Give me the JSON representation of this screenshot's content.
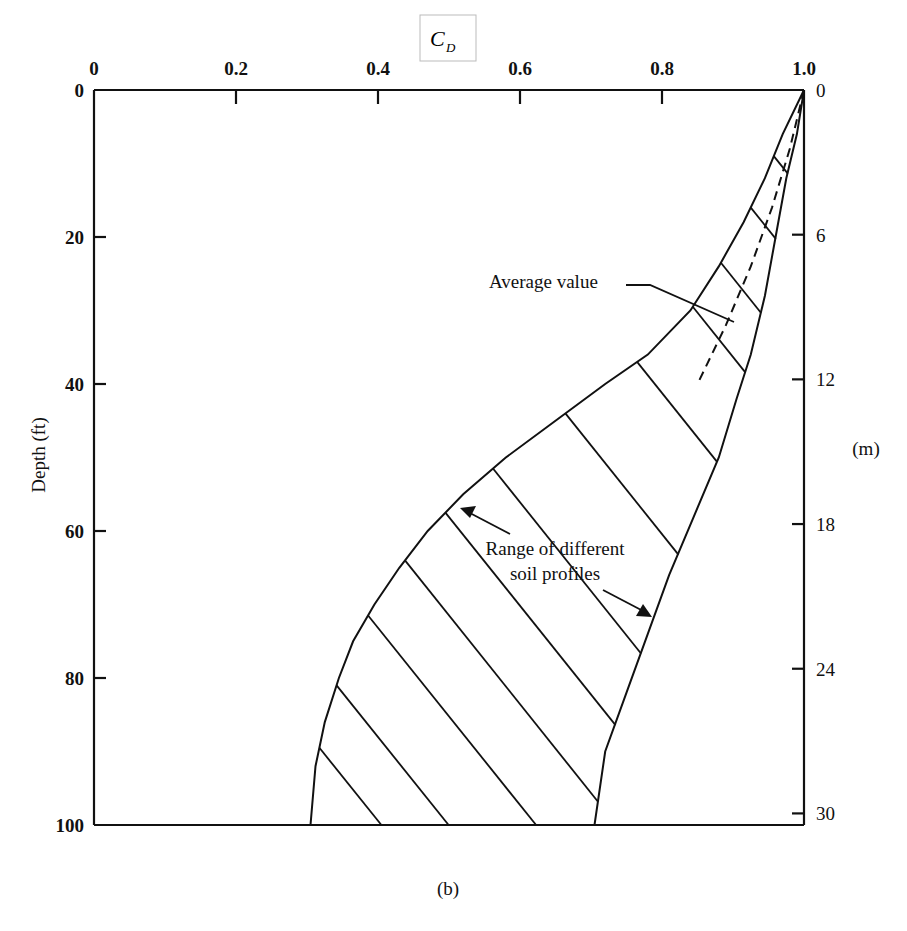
{
  "chart_data": {
    "type": "line",
    "title": "",
    "panel_label": "(b)",
    "xlabel": "C_D",
    "xlabel_main": "C",
    "xlabel_sub": "D",
    "ylabel": "Depth (ft)",
    "ylabel_right": "(m)",
    "xlim": [
      0,
      1.0
    ],
    "ylim": [
      0,
      100
    ],
    "y_inverted": true,
    "x_axis_position": "top",
    "x_ticks": [
      "0",
      "0.2",
      "0.4",
      "0.6",
      "0.8",
      "1.0"
    ],
    "x_tick_values": [
      0,
      0.2,
      0.4,
      0.6,
      0.8,
      1.0
    ],
    "y_ticks": [
      "0",
      "20",
      "40",
      "60",
      "80",
      "100"
    ],
    "y_tick_values": [
      0,
      20,
      40,
      60,
      80,
      100
    ],
    "y_right_ticks": [
      "0",
      "6",
      "12",
      "18",
      "24",
      "30"
    ],
    "y_right_tick_values_m": [
      0,
      6,
      12,
      18,
      24,
      30
    ],
    "grid": false,
    "series": [
      {
        "name": "Lower bound (range of different soil profiles)",
        "style": "solid",
        "points": [
          [
            1.0,
            0
          ],
          [
            0.97,
            6
          ],
          [
            0.945,
            12
          ],
          [
            0.915,
            18
          ],
          [
            0.88,
            24
          ],
          [
            0.84,
            30
          ],
          [
            0.78,
            36
          ],
          [
            0.72,
            40
          ],
          [
            0.65,
            45
          ],
          [
            0.58,
            50
          ],
          [
            0.52,
            55
          ],
          [
            0.47,
            60
          ],
          [
            0.43,
            65
          ],
          [
            0.395,
            70
          ],
          [
            0.365,
            75
          ],
          [
            0.345,
            80
          ],
          [
            0.325,
            86
          ],
          [
            0.312,
            92
          ],
          [
            0.305,
            100
          ]
        ]
      },
      {
        "name": "Upper bound (range of different soil profiles)",
        "style": "solid",
        "points": [
          [
            1.0,
            0
          ],
          [
            0.99,
            6
          ],
          [
            0.975,
            12
          ],
          [
            0.96,
            20
          ],
          [
            0.945,
            28
          ],
          [
            0.925,
            36
          ],
          [
            0.905,
            42
          ],
          [
            0.88,
            50
          ],
          [
            0.845,
            58
          ],
          [
            0.81,
            66
          ],
          [
            0.78,
            74
          ],
          [
            0.75,
            82
          ],
          [
            0.72,
            90
          ],
          [
            0.705,
            100
          ]
        ]
      },
      {
        "name": "Average value",
        "style": "dashed",
        "points": [
          [
            1.0,
            0
          ],
          [
            0.98,
            8
          ],
          [
            0.955,
            16
          ],
          [
            0.925,
            24
          ],
          [
            0.89,
            32
          ],
          [
            0.85,
            40
          ]
        ]
      }
    ],
    "annotations": [
      {
        "text": "Average value",
        "points_to": [
          0.88,
          34
        ]
      },
      {
        "text_line1": "Range of different",
        "text_line2": "soil profiles",
        "points_to": [
          [
            0.52,
            57
          ],
          [
            0.78,
            72
          ]
        ]
      }
    ],
    "hatch": "diagonal lines fill the region between lower and upper bounds"
  }
}
